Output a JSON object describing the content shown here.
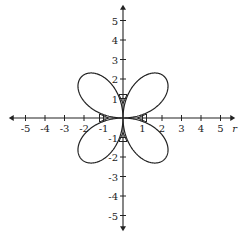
{
  "chart_data": {
    "type": "line",
    "title": "",
    "equation": "r = 3 sin(2θ)",
    "xlabel": "r",
    "ylabel": "",
    "xlim": [
      -5.5,
      5.5
    ],
    "ylim": [
      -5.5,
      5.5
    ],
    "x_ticks": [
      -5,
      -4,
      -3,
      -2,
      -1,
      1,
      2,
      3,
      4,
      5
    ],
    "y_ticks": [
      -5,
      -4,
      -3,
      -2,
      -1,
      1,
      2,
      3,
      4,
      5
    ],
    "x_tick_labels": [
      "-5",
      "-4",
      "-3",
      "-2",
      "-1",
      "1",
      "2",
      "3",
      "4",
      "5"
    ],
    "y_tick_labels": [
      "-5",
      "-4",
      "-3",
      "-2",
      "-1",
      "1",
      "2",
      "3",
      "4",
      "5"
    ],
    "grid": false,
    "legend": "none",
    "series": [
      {
        "name": "rose",
        "polar": {
          "a": 3,
          "k": 2,
          "func": "sin",
          "theta_range": [
            0,
            6.2832
          ]
        }
      }
    ],
    "direction_arrows": [
      {
        "x": 0,
        "y": 1,
        "dir": "down"
      },
      {
        "x": 0,
        "y": -1,
        "dir": "up"
      },
      {
        "x": -1,
        "y": 0,
        "dir": "right"
      },
      {
        "x": 1,
        "y": 0,
        "dir": "left"
      }
    ]
  }
}
